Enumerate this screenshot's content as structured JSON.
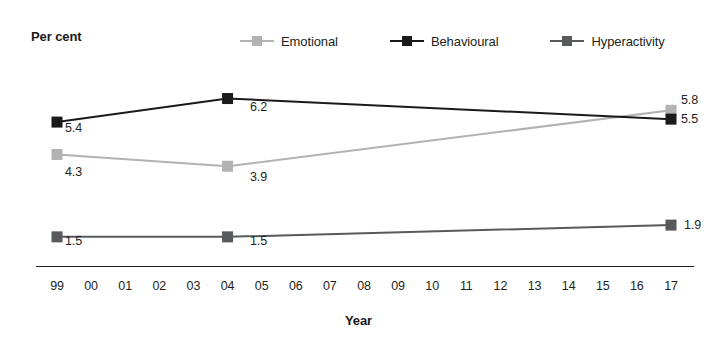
{
  "chart_data": {
    "type": "line",
    "title": "",
    "ylabel": "Per cent",
    "xlabel": "Year",
    "grid": false,
    "legend_position": "top",
    "x": [
      "99",
      "04",
      "17"
    ],
    "x_tick_labels": [
      "99",
      "00",
      "01",
      "02",
      "03",
      "04",
      "05",
      "06",
      "07",
      "08",
      "09",
      "10",
      "11",
      "12",
      "13",
      "14",
      "15",
      "16",
      "17"
    ],
    "xlim": [
      "99",
      "17"
    ],
    "ylim": [
      0,
      7
    ],
    "series": [
      {
        "name": "Emotional",
        "color": "#b2b2b2",
        "values": [
          4.3,
          3.9,
          5.8
        ],
        "point_labels": [
          "4.3",
          "3.9",
          "5.8"
        ]
      },
      {
        "name": "Behavioural",
        "color": "#1a1a1a",
        "values": [
          5.4,
          6.2,
          5.5
        ],
        "point_labels": [
          "5.4",
          "6.2",
          "5.5"
        ]
      },
      {
        "name": "Hyperactivity",
        "color": "#58595b",
        "values": [
          1.5,
          1.5,
          1.9
        ],
        "point_labels": [
          "1.5",
          "1.5",
          "1.9"
        ]
      }
    ]
  },
  "legend": {
    "items": [
      {
        "label": "Emotional"
      },
      {
        "label": "Behavioural"
      },
      {
        "label": "Hyperactivity"
      }
    ]
  },
  "axes": {
    "y_title": "Per cent",
    "x_title": "Year",
    "x_ticks": [
      "99",
      "00",
      "01",
      "02",
      "03",
      "04",
      "05",
      "06",
      "07",
      "08",
      "09",
      "10",
      "11",
      "12",
      "13",
      "14",
      "15",
      "16",
      "17"
    ]
  },
  "point_labels": {
    "emotional": {
      "p0": "4.3",
      "p1": "3.9",
      "p2": "5.8"
    },
    "behavioural": {
      "p0": "5.4",
      "p1": "6.2",
      "p2": "5.5"
    },
    "hyperactivity": {
      "p0": "1.5",
      "p1": "1.5",
      "p2": "1.9"
    }
  },
  "colors": {
    "emotional": "#b2b2b2",
    "behavioural": "#1a1a1a",
    "hyperactivity": "#58595b",
    "axis": "#231f20",
    "background": "#ffffff"
  }
}
